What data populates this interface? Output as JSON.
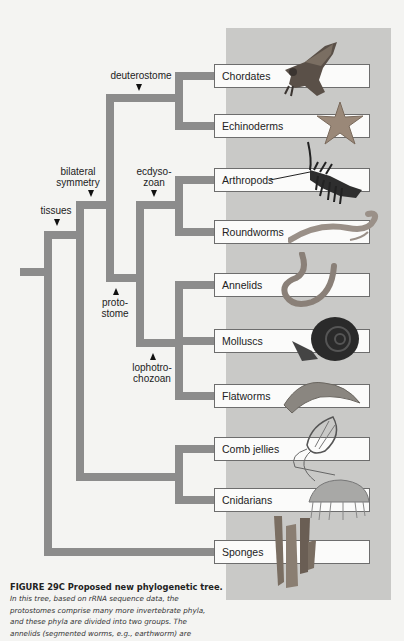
{
  "figure": {
    "caption_title": "FIGURE 29C  Proposed new phylogenetic tree.",
    "caption_lines": [
      "In this tree, based on rRNA sequence data, the",
      "protostomes comprise many more invertebrate phyla,",
      "and these phyla are divided into two groups. The",
      "annelids (segmented worms, e.g., earthworm) are"
    ]
  },
  "colors": {
    "branch": "#8c8c8c",
    "panel": "#c9c9c7",
    "background": "#f4f4f2"
  },
  "taxa": [
    {
      "label": "Chordates",
      "icon": "hawk-icon"
    },
    {
      "label": "Echinoderms",
      "icon": "starfish-icon"
    },
    {
      "label": "Arthropods",
      "icon": "lobster-icon"
    },
    {
      "label": "Roundworms",
      "icon": "roundworm-icon"
    },
    {
      "label": "Annelids",
      "icon": "earthworm-icon"
    },
    {
      "label": "Molluscs",
      "icon": "snail-icon"
    },
    {
      "label": "Flatworms",
      "icon": "flatworm-icon"
    },
    {
      "label": "Comb jellies",
      "icon": "comb-jelly-icon"
    },
    {
      "label": "Cnidarians",
      "icon": "jellyfish-icon"
    },
    {
      "label": "Sponges",
      "icon": "sponge-icon"
    }
  ],
  "nodes": {
    "deuterostome": "deuterostome",
    "bilateral_1": "bilateral",
    "bilateral_2": "symmetry",
    "ecdysozoan_1": "ecdyso-",
    "ecdysozoan_2": "zoan",
    "tissues": "tissues",
    "protostome_1": "proto-",
    "protostome_2": "stome",
    "lophotrochozoan_1": "lophotro-",
    "lophotrochozoan_2": "chozoan"
  }
}
